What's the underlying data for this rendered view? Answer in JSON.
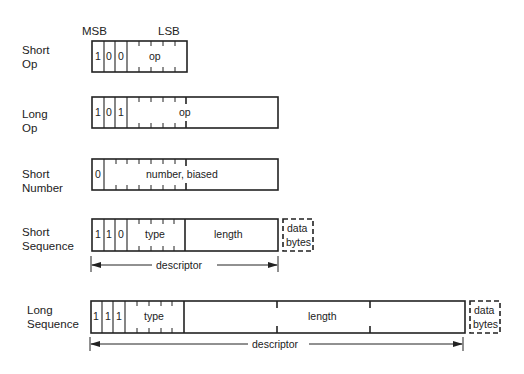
{
  "header": {
    "msb": "MSB",
    "lsb": "LSB"
  },
  "formats": [
    {
      "name_line1": "Short",
      "name_line2": "Op",
      "bits": [
        "1",
        "0",
        "0"
      ],
      "field": "op"
    },
    {
      "name_line1": "Long",
      "name_line2": "Op",
      "bits": [
        "1",
        "0",
        "1"
      ],
      "field": "op"
    },
    {
      "name_line1": "Short",
      "name_line2": "Number",
      "bits": [
        "0"
      ],
      "field": "number, biased"
    },
    {
      "name_line1": "Short",
      "name_line2": "Sequence",
      "bits": [
        "1",
        "1",
        "0"
      ],
      "field": "type",
      "field2": "length",
      "data_line1": "data",
      "data_line2": "bytes",
      "span_label": "descriptor"
    },
    {
      "name_line1": "Long",
      "name_line2": "Sequence",
      "bits": [
        "1",
        "1",
        "1"
      ],
      "field": "type",
      "field2": "length",
      "data_line1": "data",
      "data_line2": "bytes",
      "span_label": "descriptor"
    }
  ]
}
